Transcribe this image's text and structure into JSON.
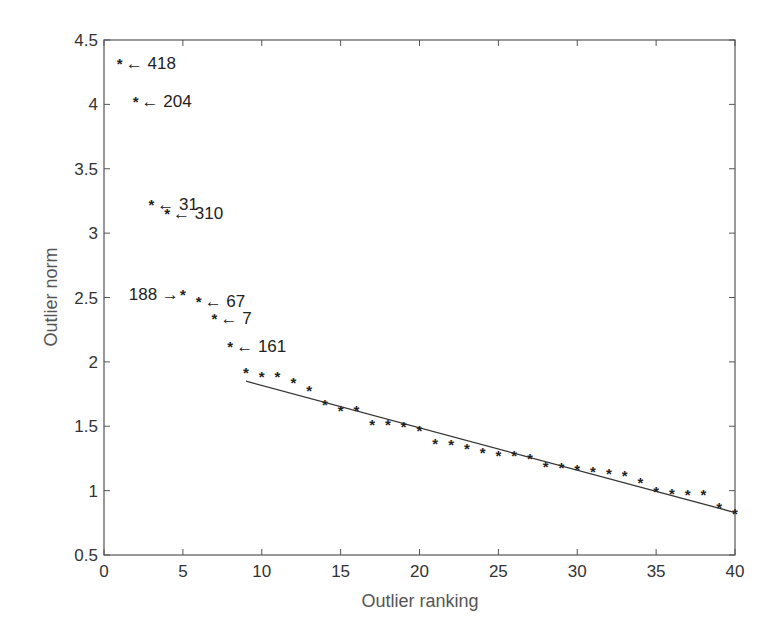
{
  "chart_data": {
    "type": "scatter",
    "title": "",
    "xlabel": "Outlier ranking",
    "ylabel": "Outlier norm",
    "xlim": [
      0,
      40
    ],
    "ylim": [
      0.5,
      4.5
    ],
    "xticks": [
      0,
      5,
      10,
      15,
      20,
      25,
      30,
      35,
      40
    ],
    "yticks": [
      0.5,
      1,
      1.5,
      2,
      2.5,
      3,
      3.5,
      4,
      4.5
    ],
    "ytick_labels": [
      "0.5",
      "1",
      "1.5",
      "2",
      "2.5",
      "3",
      "3.5",
      "4",
      "4.5"
    ],
    "grid": false,
    "legend": null,
    "marker": "*",
    "series": [
      {
        "name": "Outlier norms",
        "x": [
          1,
          2,
          3,
          4,
          5,
          6,
          7,
          8,
          9,
          10,
          11,
          12,
          13,
          14,
          15,
          16,
          17,
          18,
          19,
          20,
          21,
          22,
          23,
          24,
          25,
          26,
          27,
          28,
          29,
          30,
          31,
          32,
          33,
          34,
          35,
          36,
          37,
          38,
          39,
          40
        ],
        "y": [
          4.32,
          4.03,
          3.23,
          3.16,
          2.53,
          2.47,
          2.34,
          2.12,
          1.92,
          1.89,
          1.89,
          1.84,
          1.78,
          1.67,
          1.63,
          1.63,
          1.52,
          1.52,
          1.5,
          1.47,
          1.37,
          1.36,
          1.33,
          1.3,
          1.28,
          1.28,
          1.25,
          1.19,
          1.18,
          1.17,
          1.15,
          1.14,
          1.12,
          1.07,
          1.0,
          0.98,
          0.97,
          0.97,
          0.87,
          0.83
        ]
      },
      {
        "name": "Linear fit",
        "type": "line",
        "x": [
          9,
          40
        ],
        "y": [
          1.85,
          0.83
        ]
      }
    ],
    "annotations": [
      {
        "rank": 1,
        "label": "418",
        "arrow": "←",
        "side": "right"
      },
      {
        "rank": 2,
        "label": "204",
        "arrow": "←",
        "side": "right"
      },
      {
        "rank": 3,
        "label": "31",
        "arrow": "←",
        "side": "right"
      },
      {
        "rank": 4,
        "label": "310",
        "arrow": "←",
        "side": "right"
      },
      {
        "rank": 5,
        "label": "188",
        "arrow": "→",
        "side": "left"
      },
      {
        "rank": 6,
        "label": "67",
        "arrow": "←",
        "side": "right"
      },
      {
        "rank": 7,
        "label": "7",
        "arrow": "←",
        "side": "right"
      },
      {
        "rank": 8,
        "label": "161",
        "arrow": "←",
        "side": "right"
      }
    ]
  },
  "labels": {
    "xlabel": "Outlier ranking",
    "ylabel": "Outlier norm"
  }
}
